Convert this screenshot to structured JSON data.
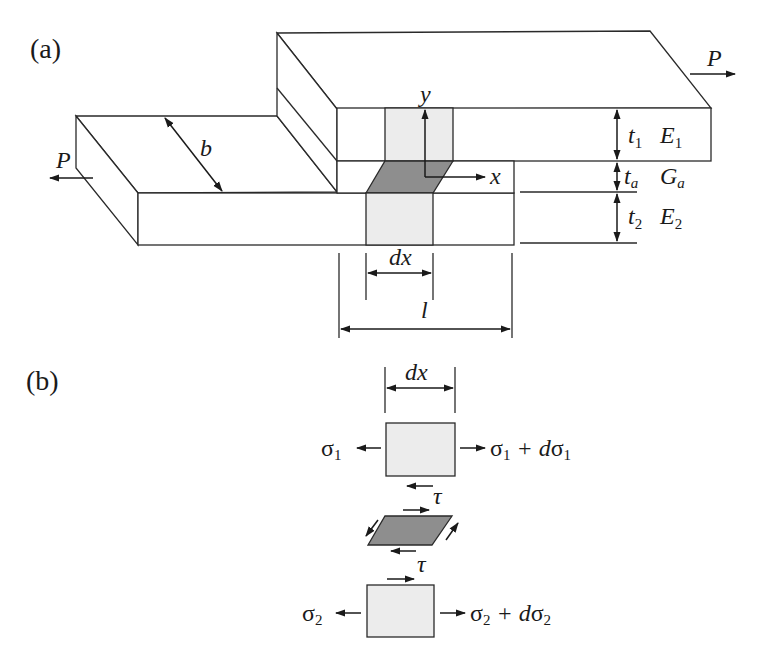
{
  "panels": {
    "a": {
      "label": "(a)"
    },
    "b": {
      "label": "(b)"
    }
  },
  "panel_a": {
    "load_left": "P",
    "load_right": "P",
    "width_label": "b",
    "axis_y": "y",
    "axis_x": "x",
    "adherend1": {
      "thickness": "t",
      "thickness_sub": "1",
      "modulus": "E",
      "modulus_sub": "1"
    },
    "adhesive": {
      "thickness": "t",
      "thickness_sub": "a",
      "modulus": "G",
      "modulus_sub": "a"
    },
    "adherend2": {
      "thickness": "t",
      "thickness_sub": "2",
      "modulus": "E",
      "modulus_sub": "2"
    },
    "element_width": "dx",
    "overlap_length": "l"
  },
  "panel_b": {
    "element_width": "dx",
    "top_left_stress": "σ",
    "top_left_sub": "1",
    "top_right_stress": "σ",
    "top_right_sub": "1",
    "top_right_plus": " + d",
    "top_right_sub2": "1",
    "shear_top": "τ",
    "shear_bottom": "τ",
    "bottom_left_stress": "σ",
    "bottom_left_sub": "2",
    "bottom_right_stress": "σ",
    "bottom_right_sub": "2",
    "bottom_right_plus": " + d",
    "bottom_right_sub2": "2"
  },
  "colors": {
    "line": "#2a2a2a",
    "light_fill": "#ececec",
    "dark_fill": "#8e8e8e"
  }
}
